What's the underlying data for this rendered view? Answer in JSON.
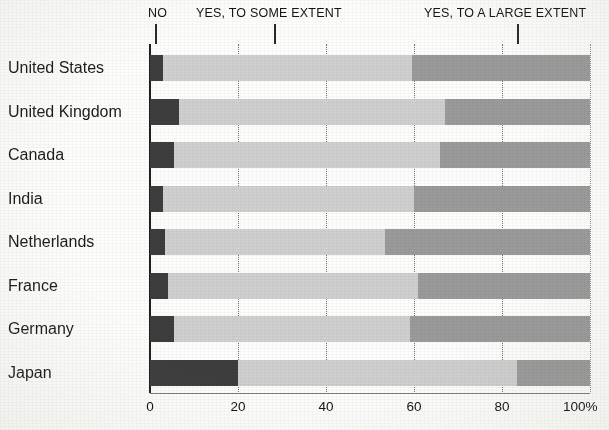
{
  "chart_data": {
    "type": "bar",
    "subtype": "horizontal-stacked-100",
    "title": "",
    "xlabel": "",
    "ylabel": "",
    "xlim": [
      0,
      100
    ],
    "grid": true,
    "grid_axis": "x",
    "legend_position": "top",
    "categories": [
      "United States",
      "United Kingdom",
      "Canada",
      "India",
      "Netherlands",
      "France",
      "Germany",
      "Japan"
    ],
    "xticks": [
      0,
      20,
      40,
      60,
      80,
      100
    ],
    "xtick_labels": [
      "0",
      "20",
      "40",
      "60",
      "80",
      "100%"
    ],
    "series": [
      {
        "name": "NO",
        "color": "#3d3d3d",
        "values": [
          3,
          6.5,
          5.5,
          3,
          3.5,
          4,
          5.5,
          20
        ]
      },
      {
        "name": "YES, TO SOME EXTENT",
        "color": "#cfcfcf",
        "values": [
          56.5,
          60.5,
          60.5,
          57,
          50,
          57,
          53.5,
          63.5
        ]
      },
      {
        "name": "YES, TO A LARGE EXTENT",
        "color": "#9a9a9a",
        "values": [
          40.5,
          33,
          34,
          40,
          46.5,
          39,
          41,
          16.5
        ]
      }
    ],
    "annotations": [
      {
        "label": "NO",
        "pointer_x": 5,
        "label_x": 5
      },
      {
        "label": "YES, TO SOME EXTENT",
        "pointer_x": 28,
        "label_x": 28
      },
      {
        "label": "YES, TO A LARGE EXTENT",
        "pointer_x": 83,
        "label_x": 83
      }
    ]
  }
}
